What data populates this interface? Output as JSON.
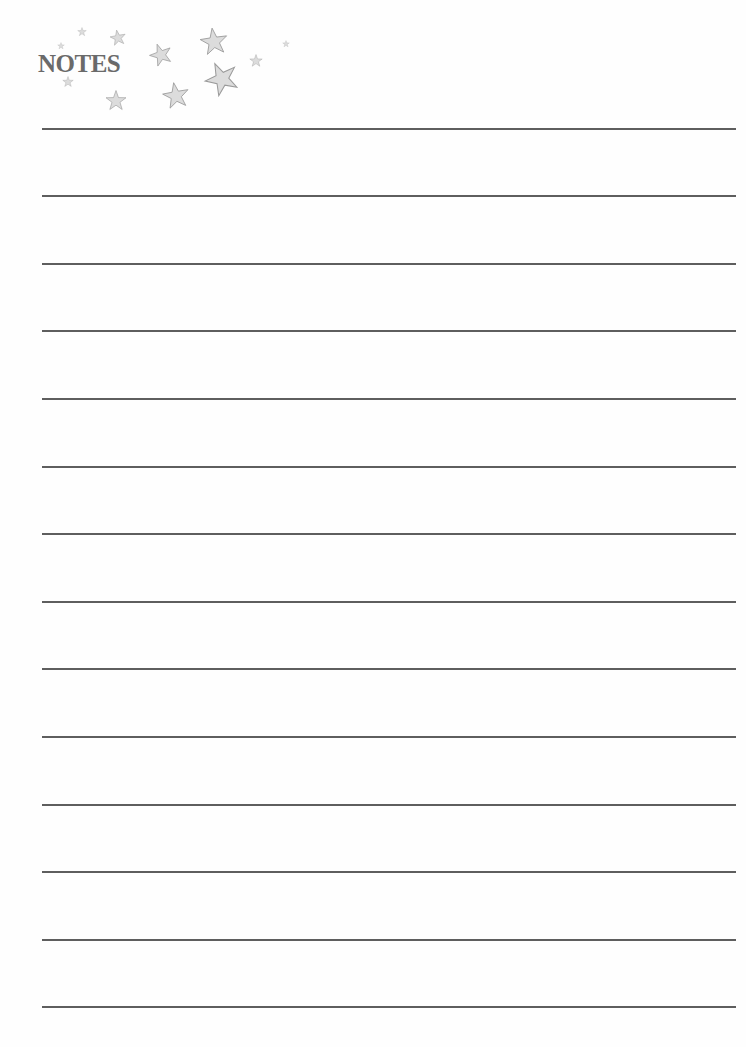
{
  "header": {
    "title": "NOTES",
    "decoration": "star-cluster"
  },
  "colors": {
    "title": "#6a6a6a",
    "star_fill": "#dcdcdc",
    "star_stroke": "#9a9a9a",
    "rule_line": "#5e5e5e"
  },
  "lines": {
    "count": 14,
    "positions": [
      128,
      195,
      263,
      330,
      398,
      466,
      533,
      601,
      668,
      736,
      804,
      871,
      939,
      1006
    ]
  }
}
